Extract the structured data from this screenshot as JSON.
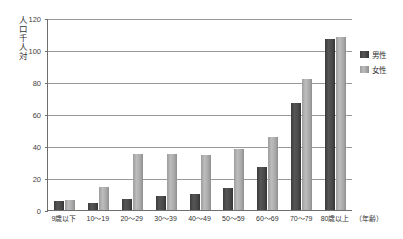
{
  "chart_data": {
    "type": "bar",
    "title": "",
    "subtitle": "",
    "xlabel": "（年齢）",
    "ylabel": "人口千人対",
    "categories": [
      "9歳以下",
      "10〜19",
      "20〜29",
      "30〜39",
      "40〜49",
      "50〜59",
      "60〜69",
      "70〜79",
      "80歳以上"
    ],
    "series": [
      {
        "name": "男性",
        "color": "#454545",
        "values": [
          5.5,
          4.5,
          7,
          8.5,
          10,
          13.5,
          27,
          67,
          107
        ]
      },
      {
        "name": "女性",
        "color": "#ababab",
        "values": [
          6.5,
          14.5,
          35,
          35,
          34.5,
          38,
          45.5,
          82,
          108
        ]
      }
    ],
    "ylim": [
      0,
      120
    ],
    "yticks": [
      0,
      20,
      40,
      60,
      80,
      100,
      120
    ],
    "ytick_labels": [
      "0",
      "20",
      "40",
      "60",
      "80",
      "100",
      "120"
    ],
    "grid": true,
    "legend_position": "right"
  },
  "axes": {
    "y_title": "人口千人対",
    "x_unit": "（年齢）"
  },
  "legend": {
    "items": [
      {
        "label": "男性"
      },
      {
        "label": "女性"
      }
    ]
  }
}
